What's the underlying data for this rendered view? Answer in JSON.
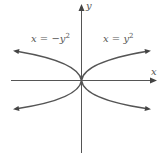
{
  "diagram": {
    "title": "",
    "axes": {
      "x_label": "x",
      "y_label": "y",
      "color": "#555555"
    },
    "curves": [
      {
        "id": "right-parabola",
        "equation_lhs": "x = y",
        "equation_exp": "2",
        "equation_full": "x = y²",
        "opens": "right"
      },
      {
        "id": "left-parabola",
        "equation_lhs": "x = −y",
        "equation_exp": "2",
        "equation_full": "x = −y²",
        "opens": "left"
      }
    ],
    "curve_color": "#555555",
    "background": "#ffffff"
  }
}
